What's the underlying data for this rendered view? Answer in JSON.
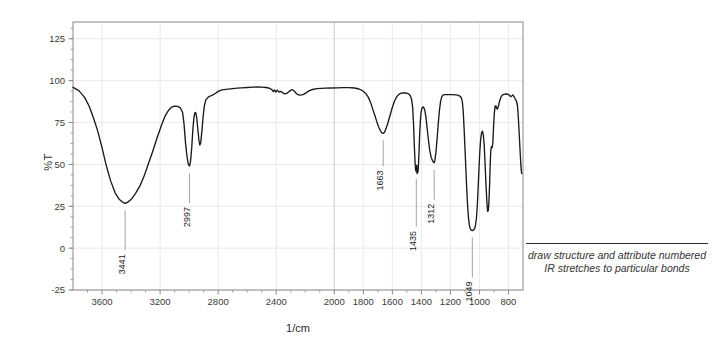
{
  "chart_data": {
    "type": "line",
    "title": "",
    "xlabel": "1/cm",
    "ylabel": "%T",
    "xlim": [
      3800,
      700
    ],
    "ylim": [
      -25,
      135
    ],
    "x_ticks": [
      3600,
      3200,
      2800,
      2400,
      2000,
      1800,
      1600,
      1400,
      1200,
      1000,
      800
    ],
    "x_tick_labels": [
      "3600",
      "3200",
      "2800",
      "2400",
      "2000",
      "1800",
      "1600",
      "1400",
      "1200",
      "1000",
      "800"
    ],
    "y_ticks": [
      -25,
      0,
      25,
      50,
      75,
      100,
      125
    ],
    "y_tick_labels": [
      "-25",
      "0",
      "25",
      "50",
      "75",
      "100",
      "125"
    ],
    "grid": true,
    "legend": "none",
    "series": [
      {
        "name": "IR transmittance",
        "color": "#1a1a1a",
        "points": [
          [
            3800,
            96.0
          ],
          [
            3760,
            94.0
          ],
          [
            3720,
            90.0
          ],
          [
            3690,
            85.0
          ],
          [
            3660,
            78.0
          ],
          [
            3630,
            70.0
          ],
          [
            3600,
            60.0
          ],
          [
            3570,
            49.0
          ],
          [
            3540,
            40.0
          ],
          [
            3510,
            33.0
          ],
          [
            3480,
            29.0
          ],
          [
            3455,
            27.2
          ],
          [
            3441,
            26.8
          ],
          [
            3425,
            27.3
          ],
          [
            3400,
            29.0
          ],
          [
            3370,
            32.5
          ],
          [
            3340,
            37.0
          ],
          [
            3310,
            43.0
          ],
          [
            3280,
            50.5
          ],
          [
            3250,
            58.0
          ],
          [
            3220,
            66.0
          ],
          [
            3190,
            73.5
          ],
          [
            3165,
            79.0
          ],
          [
            3140,
            82.5
          ],
          [
            3120,
            84.2
          ],
          [
            3100,
            84.8
          ],
          [
            3080,
            84.6
          ],
          [
            3060,
            83.7
          ],
          [
            3045,
            81.0
          ],
          [
            3035,
            74.0
          ],
          [
            3025,
            63.0
          ],
          [
            3015,
            55.0
          ],
          [
            3005,
            50.0
          ],
          [
            2997,
            49.0
          ],
          [
            2990,
            52.0
          ],
          [
            2982,
            60.0
          ],
          [
            2975,
            70.0
          ],
          [
            2968,
            77.0
          ],
          [
            2962,
            80.5
          ],
          [
            2955,
            81.0
          ],
          [
            2948,
            78.0
          ],
          [
            2940,
            71.0
          ],
          [
            2932,
            64.0
          ],
          [
            2926,
            61.5
          ],
          [
            2920,
            63.0
          ],
          [
            2912,
            70.0
          ],
          [
            2903,
            79.0
          ],
          [
            2895,
            85.0
          ],
          [
            2885,
            88.5
          ],
          [
            2870,
            90.0
          ],
          [
            2855,
            90.8
          ],
          [
            2840,
            91.3
          ],
          [
            2820,
            92.3
          ],
          [
            2800,
            93.6
          ],
          [
            2780,
            94.3
          ],
          [
            2760,
            94.6
          ],
          [
            2730,
            94.9
          ],
          [
            2700,
            95.2
          ],
          [
            2670,
            95.5
          ],
          [
            2640,
            95.7
          ],
          [
            2600,
            95.9
          ],
          [
            2560,
            96.1
          ],
          [
            2530,
            96.2
          ],
          [
            2500,
            96.1
          ],
          [
            2470,
            95.9
          ],
          [
            2450,
            95.6
          ],
          [
            2430,
            94.6
          ],
          [
            2420,
            93.4
          ],
          [
            2412,
            94.4
          ],
          [
            2402,
            93.2
          ],
          [
            2392,
            94.3
          ],
          [
            2380,
            93.1
          ],
          [
            2368,
            93.6
          ],
          [
            2355,
            92.7
          ],
          [
            2340,
            92.1
          ],
          [
            2325,
            92.5
          ],
          [
            2310,
            93.6
          ],
          [
            2295,
            94.6
          ],
          [
            2280,
            94.2
          ],
          [
            2265,
            92.6
          ],
          [
            2250,
            91.6
          ],
          [
            2235,
            91.3
          ],
          [
            2215,
            91.6
          ],
          [
            2195,
            92.7
          ],
          [
            2175,
            93.9
          ],
          [
            2150,
            94.7
          ],
          [
            2120,
            95.2
          ],
          [
            2090,
            95.4
          ],
          [
            2060,
            95.5
          ],
          [
            2020,
            95.6
          ],
          [
            1980,
            95.7
          ],
          [
            1940,
            95.8
          ],
          [
            1900,
            95.8
          ],
          [
            1860,
            95.6
          ],
          [
            1830,
            95.0
          ],
          [
            1805,
            94.0
          ],
          [
            1785,
            92.5
          ],
          [
            1765,
            90.0
          ],
          [
            1750,
            87.0
          ],
          [
            1735,
            83.0
          ],
          [
            1720,
            79.0
          ],
          [
            1707,
            75.5
          ],
          [
            1695,
            72.5
          ],
          [
            1683,
            70.2
          ],
          [
            1672,
            68.8
          ],
          [
            1663,
            68.5
          ],
          [
            1654,
            69.2
          ],
          [
            1643,
            71.5
          ],
          [
            1630,
            75.0
          ],
          [
            1615,
            79.5
          ],
          [
            1600,
            84.0
          ],
          [
            1585,
            87.8
          ],
          [
            1570,
            90.4
          ],
          [
            1555,
            91.8
          ],
          [
            1540,
            92.5
          ],
          [
            1520,
            92.7
          ],
          [
            1505,
            92.6
          ],
          [
            1490,
            92.2
          ],
          [
            1478,
            91.3
          ],
          [
            1468,
            89.0
          ],
          [
            1460,
            84.0
          ],
          [
            1454,
            74.0
          ],
          [
            1449,
            62.0
          ],
          [
            1444,
            52.0
          ],
          [
            1440,
            46.5
          ],
          [
            1437,
            48.5
          ],
          [
            1435,
            45.5
          ],
          [
            1432,
            49.5
          ],
          [
            1429,
            44.5
          ],
          [
            1426,
            47.0
          ],
          [
            1423,
            45.5
          ],
          [
            1420,
            50.0
          ],
          [
            1416,
            58.0
          ],
          [
            1412,
            68.0
          ],
          [
            1407,
            76.0
          ],
          [
            1402,
            81.0
          ],
          [
            1396,
            83.5
          ],
          [
            1390,
            84.3
          ],
          [
            1384,
            84.0
          ],
          [
            1377,
            82.5
          ],
          [
            1370,
            79.0
          ],
          [
            1362,
            73.0
          ],
          [
            1352,
            65.0
          ],
          [
            1342,
            58.0
          ],
          [
            1332,
            54.0
          ],
          [
            1322,
            52.0
          ],
          [
            1315,
            51.2
          ],
          [
            1312,
            51.0
          ],
          [
            1307,
            52.5
          ],
          [
            1300,
            57.0
          ],
          [
            1292,
            65.0
          ],
          [
            1284,
            74.0
          ],
          [
            1276,
            82.0
          ],
          [
            1268,
            87.5
          ],
          [
            1260,
            90.3
          ],
          [
            1252,
            91.3
          ],
          [
            1240,
            91.6
          ],
          [
            1225,
            91.6
          ],
          [
            1205,
            91.6
          ],
          [
            1185,
            91.6
          ],
          [
            1165,
            91.5
          ],
          [
            1150,
            91.3
          ],
          [
            1135,
            90.8
          ],
          [
            1125,
            89.8
          ],
          [
            1118,
            87.5
          ],
          [
            1112,
            82.0
          ],
          [
            1106,
            72.0
          ],
          [
            1100,
            60.0
          ],
          [
            1094,
            48.0
          ],
          [
            1088,
            36.0
          ],
          [
            1082,
            26.0
          ],
          [
            1076,
            18.5
          ],
          [
            1070,
            14.0
          ],
          [
            1064,
            11.8
          ],
          [
            1057,
            10.8
          ],
          [
            1049,
            10.5
          ],
          [
            1042,
            10.7
          ],
          [
            1035,
            11.4
          ],
          [
            1028,
            13.2
          ],
          [
            1021,
            17.5
          ],
          [
            1015,
            25.0
          ],
          [
            1009,
            36.0
          ],
          [
            1003,
            48.0
          ],
          [
            997,
            58.5
          ],
          [
            991,
            65.5
          ],
          [
            985,
            69.0
          ],
          [
            979,
            69.8
          ],
          [
            973,
            67.5
          ],
          [
            967,
            61.0
          ],
          [
            961,
            50.0
          ],
          [
            955,
            38.0
          ],
          [
            949,
            28.0
          ],
          [
            944,
            22.0
          ],
          [
            939,
            22.5
          ],
          [
            935,
            27.0
          ],
          [
            930,
            38.0
          ],
          [
            926,
            50.0
          ],
          [
            922,
            58.0
          ],
          [
            918,
            60.5
          ],
          [
            913,
            60.0
          ],
          [
            908,
            62.5
          ],
          [
            903,
            72.0
          ],
          [
            898,
            80.0
          ],
          [
            893,
            84.5
          ],
          [
            887,
            85.0
          ],
          [
            882,
            83.5
          ],
          [
            876,
            83.0
          ],
          [
            870,
            84.5
          ],
          [
            862,
            87.5
          ],
          [
            853,
            90.0
          ],
          [
            843,
            91.3
          ],
          [
            832,
            91.8
          ],
          [
            820,
            92.0
          ],
          [
            808,
            92.0
          ],
          [
            796,
            91.5
          ],
          [
            786,
            90.5
          ],
          [
            778,
            90.8
          ],
          [
            770,
            91.5
          ],
          [
            762,
            90.5
          ],
          [
            754,
            89.0
          ],
          [
            746,
            88.0
          ],
          [
            738,
            85.0
          ],
          [
            732,
            78.0
          ],
          [
            726,
            68.0
          ],
          [
            720,
            58.0
          ],
          [
            715,
            50.0
          ],
          [
            711,
            45.5
          ],
          [
            708,
            44.5
          ]
        ]
      }
    ],
    "annotations": [
      {
        "label": "3441",
        "x": 3441,
        "y": 26.8
      },
      {
        "label": "2997",
        "x": 2997,
        "y": 49.0
      },
      {
        "label": "1663",
        "x": 1663,
        "y": 68.5
      },
      {
        "label": "1435",
        "x": 1435,
        "y": 45.5
      },
      {
        "label": "1312",
        "x": 1312,
        "y": 51.0
      },
      {
        "label": "1049",
        "x": 1049,
        "y": 10.5
      }
    ]
  },
  "side_note": {
    "text": "draw structure and attribute numbered IR stretches to particular bonds"
  },
  "colors": {
    "trace": "#1a1a1a",
    "axis": "#8a8a8a",
    "grid": "#e9e9ef",
    "text": "#333333",
    "rule": "#2b2b2b"
  }
}
